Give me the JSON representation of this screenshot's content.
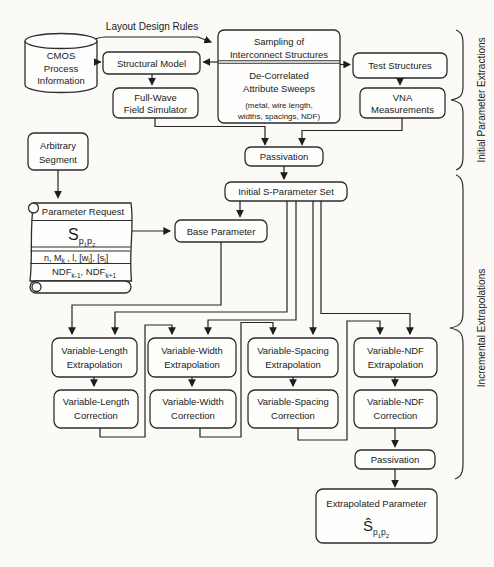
{
  "colors": {
    "stroke": "#2d2d2d",
    "background": "#fbfaf7",
    "box_fill": "#fefefd",
    "text": "#1b1b1b"
  },
  "top": {
    "layout_design_rules": "Layout Design Rules",
    "cmos_cylinder": {
      "line1": "CMOS",
      "line2": "Process",
      "line3": "Information"
    },
    "structural_model": "Structural Model",
    "sampling_box": {
      "line1": "Sampling of",
      "line2": "Interconnect Structures",
      "line3": "De-Correlated",
      "line4": "Attribute Sweeps",
      "line5": "(metal, wire length,",
      "line6": "widths, spacings, NDF)"
    },
    "test_structures": "Test Structures",
    "vna": {
      "line1": "VNA",
      "line2": "Measurements"
    },
    "full_wave": {
      "line1": "Full-Wave",
      "line2": "Field Simulator"
    },
    "passivation": "Passivation"
  },
  "left": {
    "arbitrary": {
      "line1": "Arbitrary",
      "line2": "Segment"
    },
    "scroll": {
      "header": "Parameter Request",
      "s_formula": [
        {
          "t": "S",
          "size": "16px"
        },
        {
          "t": "p",
          "dy": 4,
          "size": "9px"
        },
        {
          "t": "1",
          "dy": 3,
          "size": "6px"
        },
        {
          "t": "p",
          "dy": -3,
          "size": "9px"
        },
        {
          "t": "2",
          "dy": 3,
          "size": "6px"
        }
      ],
      "attrs": [
        {
          "t": "n, M",
          "size": "9px"
        },
        {
          "t": "k",
          "dy": 2.5,
          "size": "6.5px"
        },
        {
          "t": " , l, [w",
          "dy": -2.5,
          "size": "9px"
        },
        {
          "t": "i",
          "dy": 2.5,
          "size": "6.5px"
        },
        {
          "t": "], [s",
          "dy": -2.5,
          "size": "9px"
        },
        {
          "t": "i",
          "dy": 2.5,
          "size": "6.5px"
        },
        {
          "t": "]",
          "dy": -2.5,
          "size": "9px"
        }
      ],
      "ndf": [
        {
          "t": "NDF",
          "size": "9.5px"
        },
        {
          "t": "k-1",
          "dy": 2.5,
          "size": "6.5px"
        },
        {
          "t": ", NDF",
          "dy": -2.5,
          "size": "9.5px"
        },
        {
          "t": "k+1",
          "dy": 2.5,
          "size": "6.5px"
        }
      ]
    }
  },
  "middle": {
    "initial_s_parameter_set": "Initial S-Parameter Set",
    "base_parameter": "Base Parameter"
  },
  "cols": [
    {
      "l1": "Variable-Length",
      "l2": "Extrapolation",
      "c1": "Variable-Length",
      "c2": "Correction"
    },
    {
      "l1": "Variable-Width",
      "l2": "Extrapolation",
      "c1": "Variable-Width",
      "c2": "Correction"
    },
    {
      "l1": "Variable-Spacing",
      "l2": "Extrapolation",
      "c1": "Variable-Spacing",
      "c2": "Correction"
    },
    {
      "l1": "Variable-NDF",
      "l2": "Extrapolation",
      "c1": "Variable-NDF",
      "c2": "Correction"
    }
  ],
  "bottom": {
    "passivation": "Passivation",
    "extrapolated": {
      "title": "Extrapolated Parameter",
      "formula": [
        {
          "t": "Ŝ",
          "size": "15px"
        },
        {
          "t": "p",
          "dy": 4,
          "size": "8.5px"
        },
        {
          "t": "1",
          "dy": 3,
          "size": "6px"
        },
        {
          "t": "p",
          "dy": -3,
          "size": "8.5px"
        },
        {
          "t": "2",
          "dy": 3,
          "size": "6px"
        }
      ]
    }
  },
  "braces": {
    "top_label": "Initial Parameter Extractions",
    "bottom_label": "Incremental Extrapolations"
  }
}
